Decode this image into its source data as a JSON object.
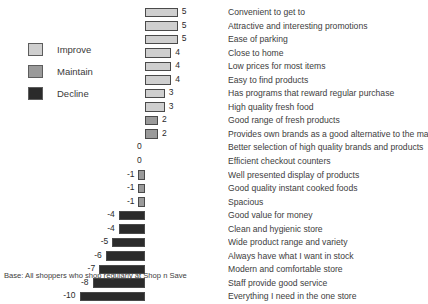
{
  "chart_data": {
    "type": "bar",
    "orientation": "horizontal",
    "title": "",
    "subtitle": "",
    "xlabel": "",
    "ylabel": "",
    "xlim": [
      -10,
      5
    ],
    "grid": false,
    "zero_baseline": true,
    "units_per_value": 6.55,
    "categories": [
      "Convenient to get to",
      "Attractive and interesting promotions",
      "Ease of parking",
      "Close to home",
      "Low prices for most items",
      "Easy to find products",
      "Has programs that reward regular purchase",
      "High quality fresh food",
      "Good range of fresh products",
      "Provides own brands as a good alternative to the main...",
      "Better selection of high quality brands and products",
      "Efficient checkout counters",
      "Well presented display of products",
      "Good quality instant cooked foods",
      "Spacious",
      "Good value for money",
      "Clean and hygienic store",
      "Wide product range and variety",
      "Always have what I want in stock",
      "Modern and comfortable store",
      "Staff provide good service",
      "Everything I need in the one store"
    ],
    "values": [
      5,
      5,
      5,
      4,
      4,
      4,
      3,
      3,
      2,
      2,
      0,
      0,
      -1,
      -1,
      -1,
      -4,
      -4,
      -5,
      -6,
      -7,
      -8,
      -10
    ],
    "value_labels": [
      "5",
      "5",
      "5",
      "4",
      "4",
      "4",
      "3",
      "3",
      "2",
      "2",
      "0",
      "0",
      "-1",
      "-1",
      "-1",
      "-4",
      "-4",
      "-5",
      "-6",
      "-7",
      "-8",
      "-10"
    ],
    "segment": [
      "Improve",
      "Improve",
      "Improve",
      "Improve",
      "Improve",
      "Improve",
      "Improve",
      "Improve",
      "Maintain",
      "Maintain",
      "None",
      "None",
      "Maintain",
      "Maintain",
      "Maintain",
      "Decline",
      "Decline",
      "Decline",
      "Decline",
      "Decline",
      "Decline",
      "Decline"
    ]
  },
  "legend": {
    "position": "left",
    "items": [
      {
        "label": "Improve",
        "color": "#cfcfcf"
      },
      {
        "label": "Maintain",
        "color": "#9a9a9a"
      },
      {
        "label": "Decline",
        "color": "#2b2b2b"
      }
    ]
  },
  "colors": {
    "improve": "#cfcfcf",
    "maintain": "#9a9a9a",
    "decline": "#2b2b2b",
    "border": "#4a4a4a",
    "text": "#3d3d3d",
    "background": "#ffffff"
  },
  "footer": {
    "note": "Base: All shoppers who shop regularly at Shop n Save"
  }
}
